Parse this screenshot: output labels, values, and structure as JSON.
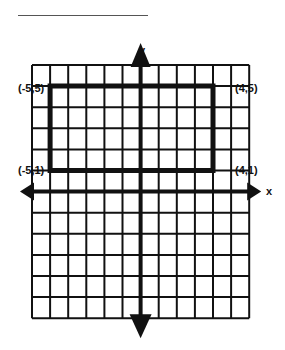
{
  "header": {
    "blank_line": ""
  },
  "grid": {
    "x_min": -6,
    "x_max": 6,
    "y_min": -6,
    "y_max": 6,
    "left_px": 32,
    "top_px": 65,
    "cell_w": 18.1,
    "cell_h": 21.1
  },
  "axes": {
    "x_label": "x",
    "y_label": "y"
  },
  "rectangle": {
    "vertices": [
      {
        "label": "(-5,5)",
        "x": -5,
        "y": 5
      },
      {
        "label": "(4,5)",
        "x": 4,
        "y": 5
      },
      {
        "label": "(4,1)",
        "x": 4,
        "y": 1
      },
      {
        "label": "(-5,1)",
        "x": -5,
        "y": 1
      }
    ]
  },
  "colors": {
    "grid": "#111111",
    "background": "#ffffff"
  }
}
